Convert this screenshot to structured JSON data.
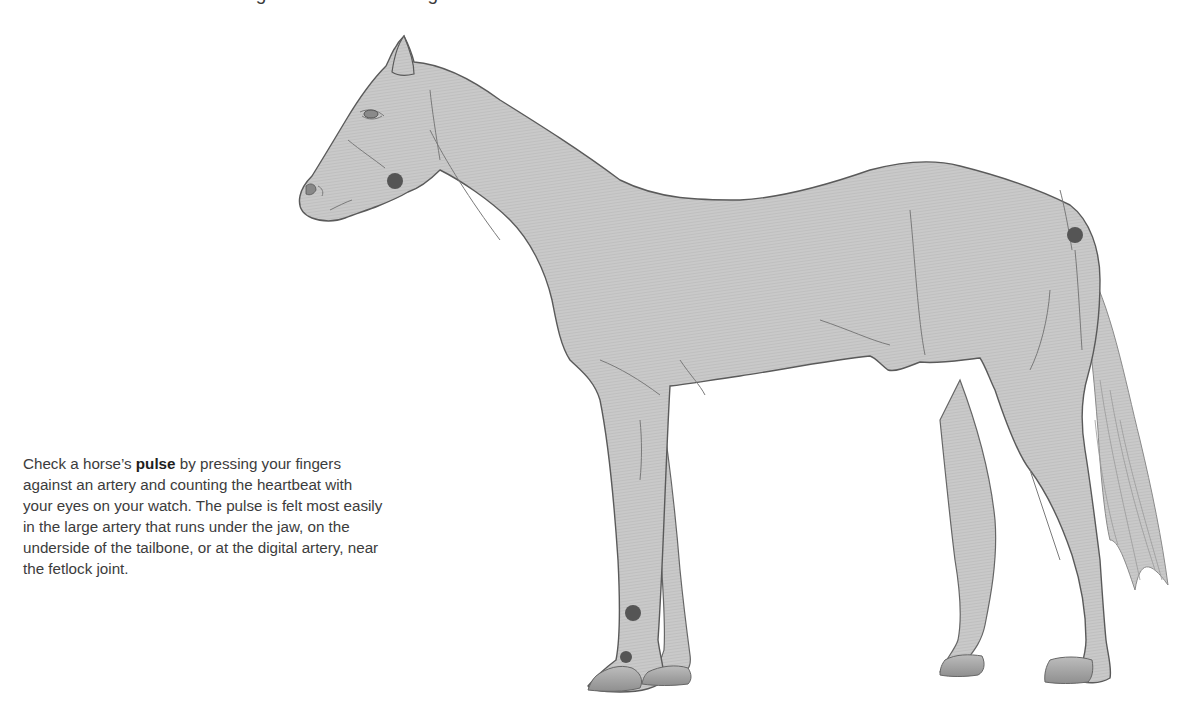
{
  "page": {
    "cropped_heading": "how to check the vital signs of a horse during an examination"
  },
  "caption": {
    "before": "Check a horse’s ",
    "bold": "pulse",
    "after": " by pressing your fingers against an artery and counting the heartbeat with your eyes on your watch. The pulse is felt most easily in the large artery that runs under the jaw, on the underside of the tailbone, or at the digital artery, near the fetlock joint."
  },
  "illustration": {
    "subject": "horse-side-view",
    "colors": {
      "body_fill": "#c9c9c9",
      "outline": "#5a5a5a",
      "shading": "#a9a9a9",
      "pulse_point": "#555555",
      "background": "#ffffff"
    },
    "pulse_points": [
      {
        "name": "jaw-artery",
        "label": "under the jaw",
        "x": 395,
        "y": 181,
        "r": 8
      },
      {
        "name": "tailbone-artery",
        "label": "underside of the tailbone",
        "x": 1075,
        "y": 235,
        "r": 8
      },
      {
        "name": "digital-artery-upper",
        "label": "digital artery",
        "x": 633,
        "y": 613,
        "r": 8
      },
      {
        "name": "fetlock-artery",
        "label": "near the fetlock joint",
        "x": 626,
        "y": 657,
        "r": 6
      }
    ]
  }
}
